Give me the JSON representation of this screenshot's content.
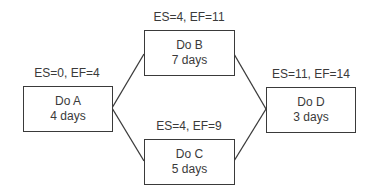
{
  "diagram": {
    "type": "activity-on-node network",
    "nodes": [
      {
        "id": "A",
        "name": "Do A",
        "duration": "4 days",
        "times": "ES=0, EF=4"
      },
      {
        "id": "B",
        "name": "Do B",
        "duration": "7 days",
        "times": "ES=4, EF=11"
      },
      {
        "id": "C",
        "name": "Do C",
        "duration": "5 days",
        "times": "ES=4, EF=9"
      },
      {
        "id": "D",
        "name": "Do D",
        "duration": "3 days",
        "times": "ES=11, EF=14"
      }
    ],
    "edges": [
      {
        "from": "A",
        "to": "B"
      },
      {
        "from": "A",
        "to": "C"
      },
      {
        "from": "B",
        "to": "D"
      },
      {
        "from": "C",
        "to": "D"
      }
    ],
    "colors": {
      "line": "#3a3a3a",
      "text": "#3a3a3a",
      "background": "#ffffff"
    }
  }
}
